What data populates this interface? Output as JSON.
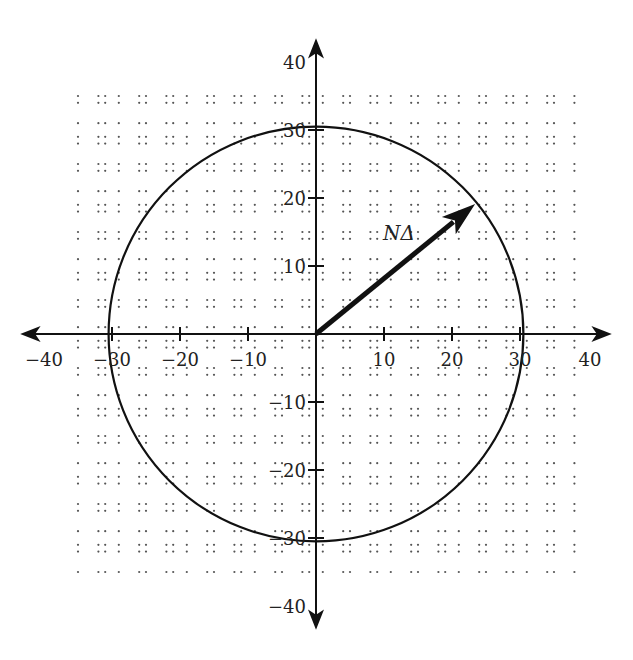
{
  "chart_data": {
    "type": "vector-diagram",
    "title": "",
    "xlabel": "",
    "ylabel": "",
    "xlim": [
      -40,
      40
    ],
    "ylim": [
      -40,
      40
    ],
    "grid": "dotted",
    "x_ticks": [
      -40,
      -30,
      -20,
      -10,
      10,
      20,
      30,
      40
    ],
    "y_ticks": [
      -40,
      -30,
      -20,
      -10,
      10,
      20,
      30,
      40
    ],
    "x_tick_labels": [
      "−40",
      "−30",
      "−20",
      "−10",
      "10",
      "20",
      "30",
      "40"
    ],
    "y_tick_labels": [
      "−40",
      "−30",
      "−20",
      "−10",
      "10",
      "20",
      "30",
      "40"
    ],
    "circle": {
      "center": [
        0,
        0
      ],
      "radius": 30.5
    },
    "vector": {
      "label": "NΔ",
      "from": [
        0,
        0
      ],
      "to": [
        23.4,
        19.1
      ]
    }
  },
  "labels": {
    "vector": "NΔ"
  },
  "colors": {
    "stroke": "#111111",
    "grid_dot": "#555555",
    "background": "#ffffff"
  }
}
